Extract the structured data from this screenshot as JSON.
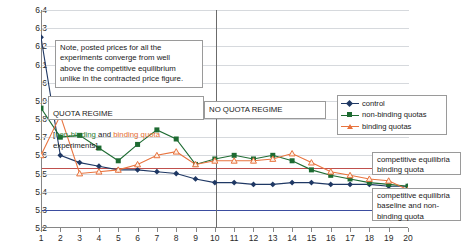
{
  "chart_data": {
    "type": "line",
    "title": "",
    "xlabel": "",
    "ylabel": "",
    "xlim": [
      1,
      20
    ],
    "ylim": [
      5.2,
      6.4
    ],
    "ytick_labels": [
      "6.4",
      "6.3",
      "6.2",
      "6.1",
      "6",
      "5.9",
      "5.8",
      "5.7",
      "5.6",
      "5.5",
      "5.4",
      "5.3",
      "5.2"
    ],
    "ytick_values": [
      6.4,
      6.3,
      6.2,
      6.1,
      6.0,
      5.9,
      5.8,
      5.7,
      5.6,
      5.5,
      5.4,
      5.3,
      5.2
    ],
    "grid": true,
    "legend_position": "upper right",
    "x": [
      1,
      2,
      3,
      4,
      5,
      6,
      7,
      8,
      9,
      10,
      11,
      12,
      13,
      14,
      15,
      16,
      17,
      18,
      19,
      20
    ],
    "xtick_labels": [
      "1",
      "2",
      "3",
      "4",
      "5",
      "6",
      "7",
      "8",
      "9",
      "10",
      "11",
      "12",
      "13",
      "14",
      "15",
      "16",
      "17",
      "18",
      "19",
      "20"
    ],
    "series": [
      {
        "name": "control",
        "color": "#1f3864",
        "marker": "diamond",
        "values": [
          6.25,
          5.6,
          5.56,
          5.54,
          5.52,
          5.52,
          5.51,
          5.5,
          5.47,
          5.45,
          5.45,
          5.44,
          5.44,
          5.45,
          5.45,
          5.44,
          5.44,
          5.44,
          5.43,
          5.43
        ]
      },
      {
        "name": "non-binding quotas",
        "color": "#1e6b32",
        "marker": "square",
        "values": [
          5.86,
          5.7,
          5.71,
          5.64,
          5.57,
          5.66,
          5.74,
          5.69,
          5.55,
          5.58,
          5.6,
          5.58,
          5.6,
          5.57,
          5.52,
          5.49,
          5.47,
          5.45,
          5.44,
          5.43
        ]
      },
      {
        "name": "binding quotas",
        "color": "#e8733e",
        "marker": "triangle",
        "values": [
          5.6,
          5.82,
          5.5,
          5.51,
          5.52,
          5.55,
          5.6,
          5.62,
          5.55,
          5.57,
          5.57,
          5.57,
          5.58,
          5.61,
          5.56,
          5.51,
          5.49,
          5.47,
          5.46,
          5.41
        ]
      }
    ],
    "reference_lines": [
      {
        "name": "competitive equilibria binding quota",
        "value": 5.53,
        "color": "#c0504d"
      },
      {
        "name": "competitive equilibria baseline and non-binding quota",
        "value": 5.3,
        "color": "#3b4da0"
      }
    ],
    "vertical_divider": {
      "x": 10,
      "color": "#6b6b6b"
    },
    "annotations": [
      {
        "id": "note",
        "text": "Note, posted prices for all the experiments converge from well above the competitive equilibrium unlike in the contracted price figure."
      },
      {
        "id": "quota_regime",
        "text": "QUOTA REGIME"
      },
      {
        "id": "no_quota_regime",
        "text": "NO QUOTA REGIME"
      }
    ]
  },
  "legend": {
    "items": [
      {
        "label": "control"
      },
      {
        "label": "non-binding quotas"
      },
      {
        "label": "binding quotas"
      }
    ]
  },
  "annotations": {
    "note_text": "Note, posted prices for all the\nexperiments converge from well\nabove the competitive equilibrium\nunlike in the contracted price figure.",
    "quota_regime_title": "QUOTA REGIME",
    "quota_regime_sub_open": "[",
    "quota_regime_sub_a": "non-binding",
    "quota_regime_sub_mid": " and ",
    "quota_regime_sub_b": "binding quota",
    "quota_regime_sub_end": " experiments].",
    "no_quota_regime": "NO QUOTA REGIME",
    "ce_binding": "competitive equilibria\nbinding quota",
    "ce_baseline": "competitive equilibria\nbaseline and non-\nbinding quota"
  }
}
